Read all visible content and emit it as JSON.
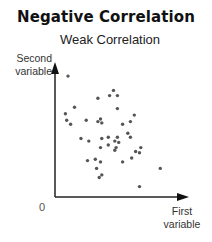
{
  "title": "Negative Correlation",
  "subtitle": "Weak Correlation",
  "axes": {
    "y_label_line1": "Second",
    "y_label_line2": "variable",
    "x_label_line1": "First",
    "x_label_line2": "variable",
    "origin_label": "0"
  },
  "colors": {
    "axis": "#222222",
    "point": "#555555"
  },
  "chart_data": {
    "type": "scatter",
    "title": "Negative Correlation",
    "subtitle": "Weak Correlation",
    "xlabel": "First variable",
    "ylabel": "Second variable",
    "origin_label": "0",
    "xlim": [
      0,
      10
    ],
    "ylim": [
      0,
      10
    ],
    "grid": false,
    "legend": null,
    "ticks": false,
    "axes_style": "arrows",
    "points": [
      [
        1.0,
        9.3
      ],
      [
        3.3,
        7.6
      ],
      [
        1.5,
        6.9
      ],
      [
        0.8,
        6.4
      ],
      [
        0.9,
        5.9
      ],
      [
        1.2,
        5.6
      ],
      [
        2.4,
        5.9
      ],
      [
        3.3,
        5.8
      ],
      [
        4.2,
        7.8
      ],
      [
        4.5,
        8.2
      ],
      [
        4.8,
        7.8
      ],
      [
        4.8,
        6.8
      ],
      [
        3.5,
        6.0
      ],
      [
        3.6,
        5.7
      ],
      [
        6.1,
        6.3
      ],
      [
        5.8,
        5.8
      ],
      [
        5.2,
        5.6
      ],
      [
        2.0,
        4.5
      ],
      [
        2.6,
        4.3
      ],
      [
        3.6,
        4.5
      ],
      [
        4.1,
        4.6
      ],
      [
        4.8,
        4.6
      ],
      [
        4.9,
        4.2
      ],
      [
        5.6,
        4.9
      ],
      [
        5.8,
        4.6
      ],
      [
        3.5,
        3.8
      ],
      [
        4.1,
        4.0
      ],
      [
        4.6,
        4.3
      ],
      [
        4.7,
        3.8
      ],
      [
        4.6,
        3.6
      ],
      [
        6.6,
        3.8
      ],
      [
        2.5,
        2.8
      ],
      [
        3.1,
        2.9
      ],
      [
        3.5,
        2.7
      ],
      [
        5.2,
        2.7
      ],
      [
        5.9,
        3.0
      ],
      [
        6.2,
        3.5
      ],
      [
        6.5,
        3.4
      ],
      [
        3.2,
        2.2
      ],
      [
        3.4,
        1.5
      ],
      [
        3.6,
        1.7
      ],
      [
        8.1,
        2.2
      ],
      [
        6.5,
        0.8
      ]
    ]
  }
}
